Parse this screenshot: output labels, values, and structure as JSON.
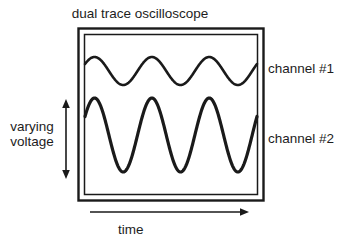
{
  "diagram": {
    "title": "dual trace oscilloscope",
    "axis": {
      "vertical_label_line1": "varying",
      "vertical_label_line2": "voltage",
      "horizontal_label": "time"
    },
    "channels": [
      {
        "id": "channel-1",
        "label": "channel #1"
      },
      {
        "id": "channel-2",
        "label": "channel #2"
      }
    ],
    "colors": {
      "stroke": "#1a1a1a",
      "background": "#ffffff",
      "text": "#1d1d1d"
    }
  },
  "chart_data": {
    "type": "line",
    "title": "dual trace oscilloscope",
    "xlabel": "time",
    "ylabel": "varying voltage",
    "grid": false,
    "legend": "right",
    "xlim": [
      0,
      3
    ],
    "ylim": [
      -1,
      1
    ],
    "series": [
      {
        "name": "channel #1",
        "waveform": "sine",
        "cycles": 3,
        "amplitude": 14,
        "baseline_y": 71,
        "phase_deg": 30,
        "stroke_width": 2.6,
        "x": [
          0,
          0.25,
          0.5,
          0.75,
          1,
          1.25,
          1.5,
          1.75,
          2,
          2.25,
          2.5,
          2.75,
          3
        ],
        "values": [
          0.5,
          1,
          0.5,
          -0.5,
          -1,
          -0.5,
          0.5,
          1,
          0.5,
          -0.5,
          -1,
          -0.5,
          0.5
        ]
      },
      {
        "name": "channel #2",
        "waveform": "sine",
        "cycles": 3,
        "amplitude": 37,
        "baseline_y": 135,
        "phase_deg": 30,
        "stroke_width": 3.2,
        "x": [
          0,
          0.25,
          0.5,
          0.75,
          1,
          1.25,
          1.5,
          1.75,
          2,
          2.25,
          2.5,
          2.75,
          3
        ],
        "values": [
          0.5,
          1,
          0.5,
          -0.5,
          -1,
          -0.5,
          0.5,
          1,
          0.5,
          -0.5,
          -1,
          -0.5,
          0.5
        ]
      }
    ]
  }
}
